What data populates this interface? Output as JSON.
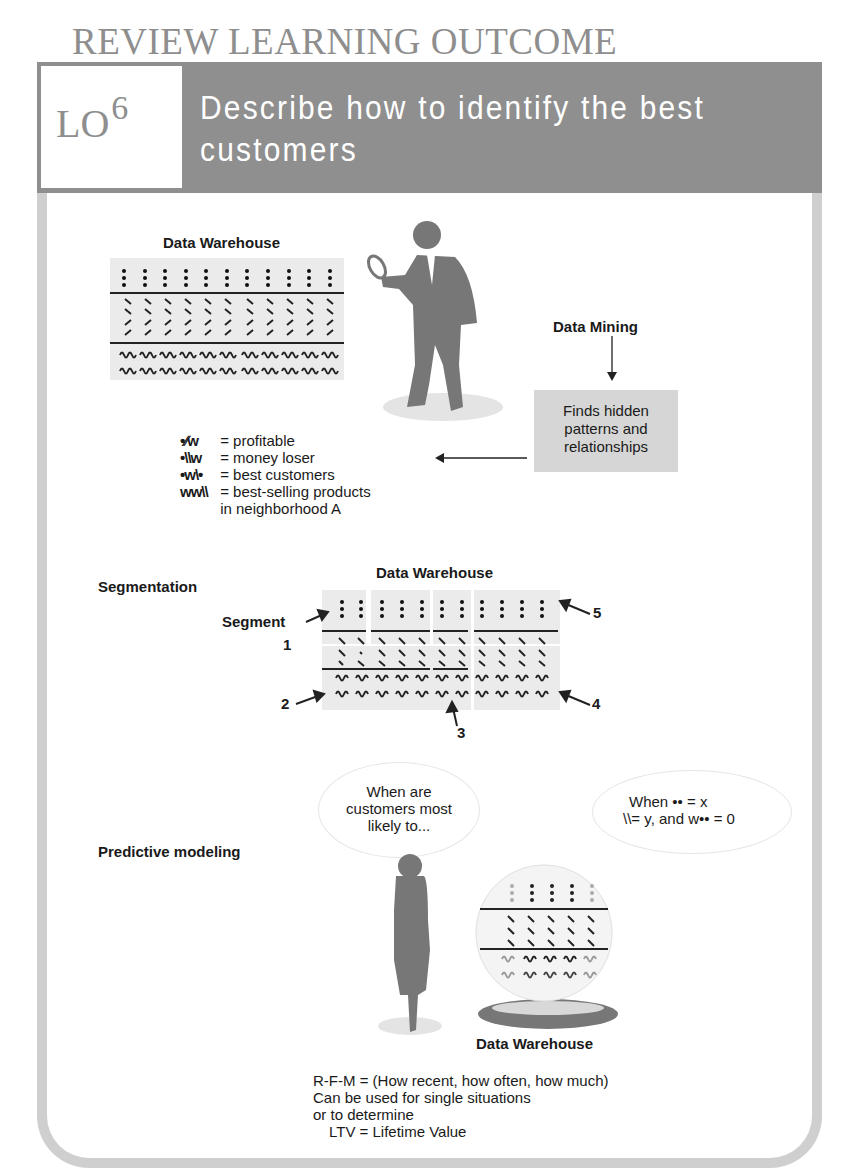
{
  "header": {
    "section_title": "REVIEW LEARNING OUTCOME",
    "lo_label": "LO",
    "lo_number": "6",
    "title": "Describe how to identify the best customers"
  },
  "data_mining_section": {
    "warehouse_label": "Data Warehouse",
    "data_mining_label": "Data Mining",
    "result_box": [
      "Finds hidden",
      "patterns and",
      "relationships"
    ],
    "legend": [
      {
        "symbol": "•∕∕w",
        "meaning": "= profitable"
      },
      {
        "symbol": "•\\\\w",
        "meaning": "= money loser"
      },
      {
        "symbol": "•w\\•",
        "meaning": "= best customers"
      },
      {
        "symbol": "ww\\\\",
        "meaning": "= best-selling products"
      },
      {
        "symbol": "",
        "meaning": "in neighborhood A"
      }
    ]
  },
  "segmentation_section": {
    "label": "Segmentation",
    "warehouse_label": "Data Warehouse",
    "segment_label": "Segment",
    "markers": [
      "1",
      "2",
      "3",
      "4",
      "5"
    ]
  },
  "predictive_section": {
    "label": "Predictive modeling",
    "question_bubble": [
      "When are",
      "customers most",
      "likely to..."
    ],
    "answer_bubble_line1": "When •• = x",
    "answer_bubble_line2": "\\\\= y, and w•• = 0",
    "warehouse_label": "Data Warehouse",
    "notes": [
      "R-F-M = (How recent, how often, how much)",
      "Can be used for single situations",
      "or to determine",
      "LTV = Lifetime Value"
    ]
  },
  "colors": {
    "banner": "#8f8f8f",
    "frame": "#cfcfcf",
    "table_bg": "#ebebeb",
    "silhouette": "#777777",
    "result_box": "#d6d6d6"
  }
}
